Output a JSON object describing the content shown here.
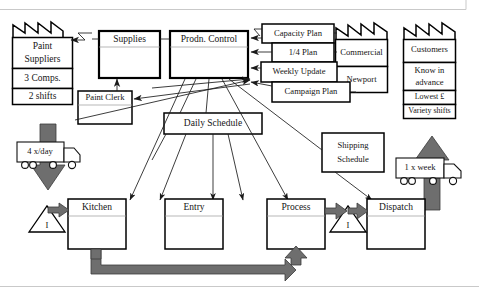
{
  "diagram": {
    "type": "value-stream-map",
    "colors": {
      "push_arrow": "#6e6e6e",
      "line": "#1a1a1a",
      "box_fill": "#ffffff",
      "box_stroke": "#000000"
    }
  },
  "suppliers": {
    "name": "Paint Suppliers",
    "name_line1": "Paint",
    "name_line2": "Suppliers",
    "attributes": [
      "3 Comps.",
      "2 shifts"
    ]
  },
  "customers": {
    "name": "Customers",
    "attributes": [
      "Know in advance",
      "Lowest £",
      "Variety shifts"
    ],
    "attr1_line1": "Know in",
    "attr1_line2": "advance",
    "attr2": "Lowest £",
    "attr3": "Variety shifts"
  },
  "commercial": {
    "name": "Commercial",
    "site": "Newport"
  },
  "information": {
    "supplies": "Supplies",
    "production_control": "Prodn. Control",
    "paint_clerk": "Paint Clerk",
    "daily_schedule": "Daily Schedule",
    "shipping_schedule_line1": "Shipping",
    "shipping_schedule_line2": "Schedule",
    "shipping_schedule": "Shipping Schedule"
  },
  "plans": [
    {
      "label": "Capacity Plan"
    },
    {
      "label": "1/4 Plan"
    },
    {
      "label": "Weekly Update"
    },
    {
      "label": "Campaign Plan"
    }
  ],
  "processes": [
    {
      "label": "Kitchen"
    },
    {
      "label": "Entry"
    },
    {
      "label": "Process"
    },
    {
      "label": "Dispatch"
    }
  ],
  "inventory": [
    {
      "label": "I",
      "location": "before-kitchen"
    },
    {
      "label": "I",
      "location": "process-to-dispatch"
    }
  ],
  "shipments": {
    "inbound": {
      "label": "4 x/day",
      "icon": "truck-icon",
      "direction": "down"
    },
    "outbound": {
      "label": "1 x week",
      "icon": "truck-icon",
      "direction": "up"
    }
  }
}
